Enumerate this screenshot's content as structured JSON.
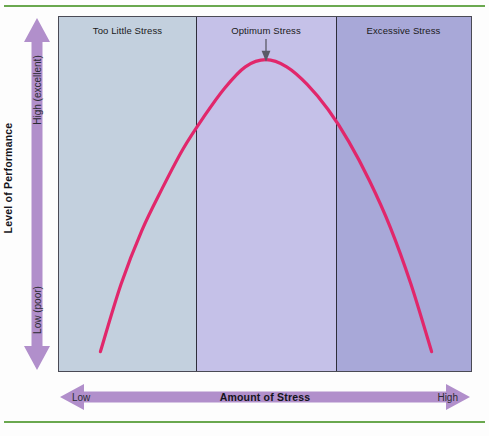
{
  "figure": {
    "background_color": "#fdfdfd",
    "rule_color": "#6aa84f",
    "plot_border_color": "#4a4a55"
  },
  "axes": {
    "y": {
      "title": "Level of Performance",
      "top_label": "High (excellent)",
      "bottom_label": "Low (poor)",
      "arrow_color": "#b18fcb",
      "direction": "double"
    },
    "x": {
      "title": "Amount of Stress",
      "left_label": "Low",
      "right_label": "High",
      "arrow_color": "#b18fcb",
      "direction": "double"
    }
  },
  "annotation": {
    "label": "Optimum Stress",
    "arrow_color": "#5a5a66",
    "points_to": "curve-peak"
  },
  "chart_data": {
    "type": "line",
    "title": "",
    "xlabel": "Amount of Stress",
    "ylabel": "Level of Performance",
    "xlim": [
      0,
      100
    ],
    "ylim": [
      0,
      100
    ],
    "grid": false,
    "legend": "none",
    "x_tick_labels": [
      "Low",
      "High"
    ],
    "y_tick_labels": [
      "Low (poor)",
      "High (excellent)"
    ],
    "series": [
      {
        "name": "Performance vs Stress",
        "color": "#e1276b",
        "line_width": 3.2,
        "shape": "inverted-u",
        "x": [
          10,
          15,
          20,
          25,
          30,
          35,
          40,
          45,
          50,
          55,
          60,
          65,
          70,
          75,
          80,
          85,
          90
        ],
        "y": [
          6,
          25,
          40,
          52,
          63,
          72,
          80,
          86,
          88,
          86,
          81,
          74,
          65,
          54,
          41,
          25,
          6
        ],
        "peak": {
          "x": 50,
          "y": 88
        }
      }
    ],
    "regions": [
      {
        "label": "Too Little Stress",
        "x_start": 0,
        "x_end": 33,
        "color": "#c3d0de"
      },
      {
        "label": "Optimum Stress",
        "x_start": 33,
        "x_end": 67,
        "color": "#c5c1e8"
      },
      {
        "label": "Excessive Stress",
        "x_start": 67,
        "x_end": 100,
        "color": "#a8a8d8"
      }
    ]
  }
}
